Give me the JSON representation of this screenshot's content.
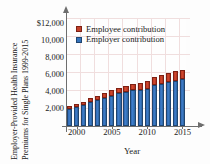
{
  "chart_data": {
    "type": "bar",
    "subtype": "stacked-column",
    "title": "",
    "ytitle_line1": "Employer-Provided Health Insurance",
    "ytitle_line2": "Premiums for Single Plans 1999-2015",
    "xlabel": "Year",
    "ylabel": "",
    "ylim": [
      0,
      12000
    ],
    "ytick_values": [
      2000,
      4000,
      6000,
      8000,
      10000,
      12000
    ],
    "ytick_labels": [
      "2,000",
      "4,000",
      "6,000",
      "8,000",
      "10,000",
      "$12,000"
    ],
    "xtick_labels": [
      "2000",
      "2005",
      "2010",
      "2015"
    ],
    "xtick_values": [
      2000,
      2005,
      2010,
      2015
    ],
    "grid": true,
    "legend_position": "top-left",
    "categories": [
      1999,
      2000,
      2001,
      2002,
      2003,
      2004,
      2005,
      2006,
      2007,
      2008,
      2009,
      2010,
      2011,
      2012,
      2013,
      2014,
      2015
    ],
    "series": [
      {
        "name": "Employer contribution",
        "color": "#3473bb",
        "values": [
          1878,
          2137,
          2361,
          2650,
          2875,
          3136,
          3383,
          3615,
          3785,
          3983,
          4045,
          4150,
          4508,
          4664,
          4885,
          5000,
          5179
        ]
      },
      {
        "name": "Employee contribution",
        "color": "#c3402a",
        "values": [
          318,
          334,
          355,
          466,
          508,
          558,
          610,
          627,
          694,
          721,
          779,
          899,
          921,
          951,
          1012,
          1081,
          1071
        ]
      }
    ],
    "totals": [
      2196,
      2471,
      2716,
      3116,
      3383,
      3694,
      3993,
      4242,
      4479,
      4704,
      4824,
      5049,
      5429,
      5615,
      5897,
      6081,
      6250
    ]
  },
  "legend": {
    "entries": [
      {
        "label": "Employee contribution",
        "swatch": "red-square-swatch"
      },
      {
        "label": "Employer contribution",
        "swatch": "blue-square-swatch"
      }
    ]
  },
  "axes": {
    "x_title": "Year"
  },
  "colors": {
    "employee_red": "#c3402a",
    "employer_blue": "#3473bb",
    "grid": "#f0dede",
    "axis": "#6e6e6e",
    "text": "#1a1a1a"
  }
}
